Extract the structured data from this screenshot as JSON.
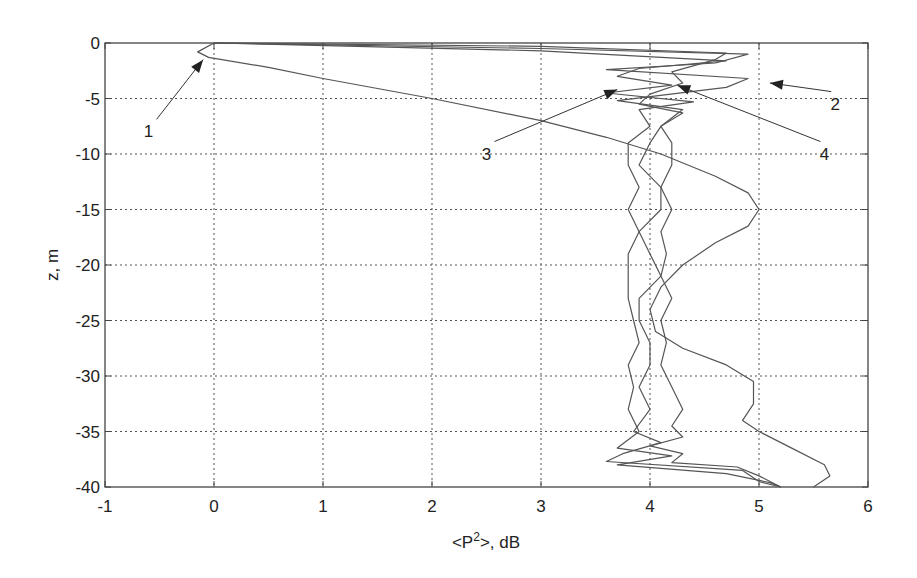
{
  "chart_data": {
    "type": "line",
    "title": "",
    "xlabel": "<P²>, dB",
    "xlabel_parts": {
      "pre": "<P",
      "sup": "2",
      "post": ">, dB"
    },
    "ylabel": "z, m",
    "xlim": [
      -1,
      6
    ],
    "ylim": [
      -40,
      0
    ],
    "grid": true,
    "legend": "none (curves identified by numbered arrow annotations)",
    "x_ticks": [
      "-1",
      "0",
      "1",
      "2",
      "3",
      "4",
      "5",
      "6"
    ],
    "y_ticks": [
      "0",
      "-5",
      "-10",
      "-15",
      "-20",
      "-25",
      "-30",
      "-35",
      "-40"
    ],
    "series": [
      {
        "name": "1",
        "points": [
          [
            0.0,
            0
          ],
          [
            -0.15,
            -0.8
          ],
          [
            -0.05,
            -1.3
          ],
          [
            0.5,
            -2.2
          ],
          [
            1.0,
            -3.2
          ],
          [
            2.0,
            -5
          ],
          [
            3.0,
            -7
          ],
          [
            3.6,
            -8.5
          ],
          [
            4.1,
            -10
          ],
          [
            4.6,
            -12
          ],
          [
            4.9,
            -13.5
          ],
          [
            5.0,
            -15
          ],
          [
            4.9,
            -16.5
          ],
          [
            4.6,
            -18
          ],
          [
            4.3,
            -20
          ],
          [
            4.1,
            -22
          ],
          [
            4.0,
            -24
          ],
          [
            4.05,
            -26
          ],
          [
            4.3,
            -27.5
          ],
          [
            4.7,
            -29
          ],
          [
            4.95,
            -30.5
          ],
          [
            4.95,
            -32.5
          ],
          [
            4.85,
            -34
          ],
          [
            5.0,
            -35
          ],
          [
            5.3,
            -36.5
          ],
          [
            5.6,
            -38
          ],
          [
            5.65,
            -39
          ],
          [
            5.5,
            -40
          ]
        ]
      },
      {
        "name": "2",
        "points": [
          [
            0.0,
            0
          ],
          [
            3.0,
            -0.5
          ],
          [
            4.9,
            -1.0
          ],
          [
            4.6,
            -1.8
          ],
          [
            3.6,
            -2.4
          ],
          [
            4.9,
            -3.2
          ],
          [
            4.7,
            -4.0
          ],
          [
            3.7,
            -5.2
          ],
          [
            4.3,
            -6
          ],
          [
            4.1,
            -7.5
          ],
          [
            4.0,
            -9
          ],
          [
            3.9,
            -11
          ],
          [
            4.1,
            -13
          ],
          [
            4.1,
            -15
          ],
          [
            3.9,
            -17
          ],
          [
            4.0,
            -19
          ],
          [
            4.1,
            -21
          ],
          [
            3.9,
            -23
          ],
          [
            3.9,
            -25
          ],
          [
            4.0,
            -27
          ],
          [
            4.0,
            -29
          ],
          [
            3.9,
            -31
          ],
          [
            4.0,
            -33
          ],
          [
            3.85,
            -35
          ],
          [
            4.1,
            -36
          ],
          [
            3.75,
            -37
          ],
          [
            3.6,
            -37.7
          ],
          [
            4.85,
            -38.5
          ],
          [
            5.0,
            -39.5
          ],
          [
            5.2,
            -40
          ]
        ]
      },
      {
        "name": "3",
        "points": [
          [
            0.0,
            0
          ],
          [
            3.0,
            -0.7
          ],
          [
            4.7,
            -1.6
          ],
          [
            3.9,
            -2.3
          ],
          [
            3.7,
            -3.0
          ],
          [
            4.2,
            -3.8
          ],
          [
            3.6,
            -4.5
          ],
          [
            4.4,
            -5.3
          ],
          [
            3.9,
            -6
          ],
          [
            4.0,
            -7.5
          ],
          [
            3.8,
            -9
          ],
          [
            3.8,
            -11
          ],
          [
            3.9,
            -13
          ],
          [
            3.8,
            -15
          ],
          [
            3.9,
            -17
          ],
          [
            3.8,
            -19
          ],
          [
            3.8,
            -21
          ],
          [
            3.8,
            -23
          ],
          [
            3.85,
            -25
          ],
          [
            3.9,
            -27
          ],
          [
            3.8,
            -29
          ],
          [
            3.85,
            -31
          ],
          [
            3.8,
            -33
          ],
          [
            3.9,
            -35
          ],
          [
            3.7,
            -36.5
          ],
          [
            4.2,
            -37.2
          ],
          [
            3.7,
            -38
          ],
          [
            4.7,
            -38.8
          ],
          [
            5.1,
            -39.6
          ],
          [
            5.2,
            -40
          ]
        ]
      },
      {
        "name": "4",
        "points": [
          [
            0.0,
            0
          ],
          [
            3.0,
            -0.3
          ],
          [
            4.7,
            -0.9
          ],
          [
            4.6,
            -1.5
          ],
          [
            4.2,
            -2.6
          ],
          [
            4.3,
            -3.6
          ],
          [
            4.0,
            -4.6
          ],
          [
            3.9,
            -5.5
          ],
          [
            4.3,
            -6.3
          ],
          [
            4.1,
            -7.5
          ],
          [
            4.2,
            -9
          ],
          [
            4.2,
            -11
          ],
          [
            4.1,
            -13
          ],
          [
            4.2,
            -15
          ],
          [
            4.1,
            -17
          ],
          [
            4.15,
            -19
          ],
          [
            4.1,
            -21
          ],
          [
            4.2,
            -23
          ],
          [
            4.1,
            -25
          ],
          [
            4.15,
            -27
          ],
          [
            4.1,
            -29
          ],
          [
            4.2,
            -31
          ],
          [
            4.3,
            -33
          ],
          [
            4.2,
            -34.5
          ],
          [
            4.3,
            -35.5
          ],
          [
            4.0,
            -36.3
          ],
          [
            4.3,
            -37
          ],
          [
            4.2,
            -37.8
          ],
          [
            4.8,
            -38.2
          ],
          [
            5.0,
            -39
          ],
          [
            5.2,
            -40
          ]
        ]
      }
    ],
    "annotations": [
      {
        "label": "1",
        "text_pos": [
          -0.6,
          -8.5
        ],
        "arrow_to": [
          -0.1,
          -1.5
        ]
      },
      {
        "label": "2",
        "text_pos": [
          5.7,
          -6.0
        ],
        "arrow_to": [
          5.1,
          -3.6
        ]
      },
      {
        "label": "3",
        "text_pos": [
          2.5,
          -10.5
        ],
        "arrow_to": [
          3.7,
          -4.2
        ]
      },
      {
        "label": "4",
        "text_pos": [
          5.6,
          -10.5
        ],
        "arrow_to": [
          4.25,
          -3.8
        ]
      }
    ]
  }
}
